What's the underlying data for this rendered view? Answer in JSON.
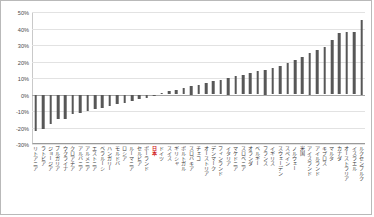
{
  "chart_data": {
    "type": "bar",
    "title": "",
    "subtitle": "",
    "xlabel": "",
    "ylabel": "",
    "ylim": [
      -30,
      50
    ],
    "grid": true,
    "legend": false,
    "y_ticks": [
      "50%",
      "40%",
      "30%",
      "20%",
      "10%",
      "0%",
      "-10%",
      "-20%",
      "-30%"
    ],
    "y_tick_values": [
      50,
      40,
      30,
      20,
      10,
      0,
      -10,
      -20,
      -30
    ],
    "highlight_category": "日本",
    "highlight_color": "#d01717",
    "bar_color": "#575757",
    "categories": [
      "リトアニア",
      "ラトビア",
      "ジョージア",
      "ブルガリア",
      "ウクライナ",
      "クロアチア",
      "アルバニア",
      "アルメニア",
      "エストニア",
      "ベラルーシ",
      "ハンガリー",
      "モルドバ",
      "ロシア",
      "ルーマニア",
      "セルビア",
      "ポーランド",
      "日本",
      "ドイツ",
      "スイス",
      "ギリシャ",
      "ポルトガル",
      "スロバキア",
      "チェコ",
      "オーストリア",
      "デンマーク",
      "フィンランド",
      "イタリア",
      "マケドニア",
      "スロベニア",
      "オランダ",
      "ベルギー",
      "フランス",
      "イギリス",
      "スウェーデン",
      "スペイン",
      "ノルウェー",
      "米国",
      "アイスランド",
      "アイルランド",
      "キプロス",
      "マルタ",
      "カナダ",
      "オーストラリア",
      "イスラエル",
      "ルクセンブルク"
    ],
    "values": [
      -22,
      -21,
      -18,
      -15,
      -15,
      -12,
      -11,
      -10,
      -9,
      -8,
      -7,
      -6,
      -5,
      -4,
      -3,
      -2,
      -1,
      1,
      2,
      3,
      4,
      5,
      6,
      7,
      8,
      9,
      10,
      11,
      12,
      13,
      14,
      15,
      16,
      17,
      19,
      21,
      23,
      25,
      27,
      29,
      33,
      37,
      38,
      38,
      45
    ]
  }
}
